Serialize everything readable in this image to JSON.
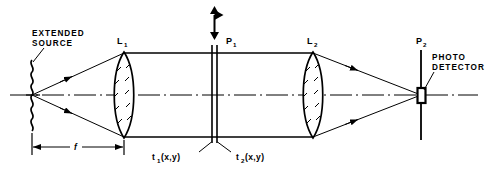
{
  "figure": {
    "background_color": "#ffffff",
    "line_color": "#000000"
  },
  "labels": {
    "source_line1": "EXTENDED",
    "source_line2": "SOURCE",
    "lens1": "L",
    "lens1_sub": "1",
    "lens2": "L",
    "lens2_sub": "2",
    "plane1": "P",
    "plane1_sub": "1",
    "plane2": "P",
    "plane2_sub": "2",
    "detector_line1": "PHOTO",
    "detector_line2": "DETECTOR",
    "transparency1": "t",
    "transparency1_sub": "1",
    "transparency1_arg": "(x,y)",
    "transparency2": "t",
    "transparency2_sub": "2",
    "transparency2_arg": "(x,y)",
    "focal_length": "f"
  },
  "elements": {
    "source_name": "extended-source",
    "lens1_name": "lens-L1",
    "lens2_name": "lens-L2",
    "plane1_name": "plane-P1",
    "plane2_name": "plane-P2",
    "detector_name": "photo-detector",
    "axis_name": "optical-axis",
    "dimension_name": "focal-length-dimension",
    "motion_arrow_name": "p1-translation-arrow"
  },
  "geometry": {
    "axis_y": 95,
    "source_x": 32,
    "lens1_x": 124,
    "plane1_x": 215,
    "lens2_x": 313,
    "plane2_x": 421,
    "beam_top_y": 53,
    "beam_bottom_y": 137
  }
}
